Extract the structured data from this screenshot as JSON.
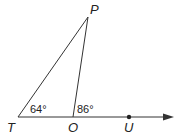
{
  "diagram": {
    "points": {
      "P": {
        "label": "P",
        "x": 88,
        "y": 17
      },
      "T": {
        "label": "T",
        "x": 18,
        "y": 117
      },
      "O": {
        "label": "O",
        "x": 73,
        "y": 117
      },
      "U": {
        "label": "U",
        "x": 129,
        "y": 117
      }
    },
    "angles": {
      "T": "64°",
      "O": "86°"
    },
    "ray": "from T through O and U, arrow pointing right",
    "colors": {
      "line": "#333333",
      "text": "#222222"
    }
  }
}
